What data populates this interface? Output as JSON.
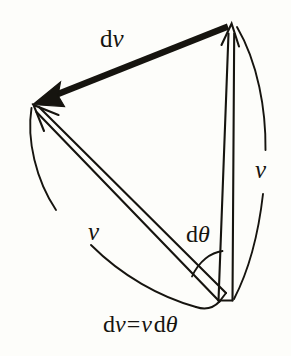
{
  "figure": {
    "type": "physics-vector-diagram",
    "background_color": "#fdfdfa",
    "ink_color": "#16140f",
    "labels": {
      "dv_vector": {
        "d": "d",
        "v": "v",
        "text": "dv"
      },
      "v_right": {
        "v": "v",
        "text": "v"
      },
      "v_left": {
        "v": "v",
        "text": "v"
      },
      "d_theta": {
        "d": "d",
        "theta": "θ",
        "text": "dθ"
      },
      "equation": {
        "lhs_d": "d",
        "lhs_v": "v",
        "equals": "=",
        "rhs_v": "v",
        "rhs_d": "d",
        "rhs_theta": "θ",
        "text": "dv = v dθ"
      }
    },
    "geometry": {
      "apex_top_right": [
        232,
        24
      ],
      "apex_left": [
        33,
        104
      ],
      "vertex_bottom": [
        225,
        301
      ],
      "right_arc_radius_label": "v",
      "left_arc_radius_label": "v",
      "angle_at_bottom": "dθ",
      "dv_arrow_direction": "from top-right apex to left apex",
      "dv_arrow_style": "thick filled",
      "v_arrow_style": "thin open sliver with arrowhead"
    }
  }
}
